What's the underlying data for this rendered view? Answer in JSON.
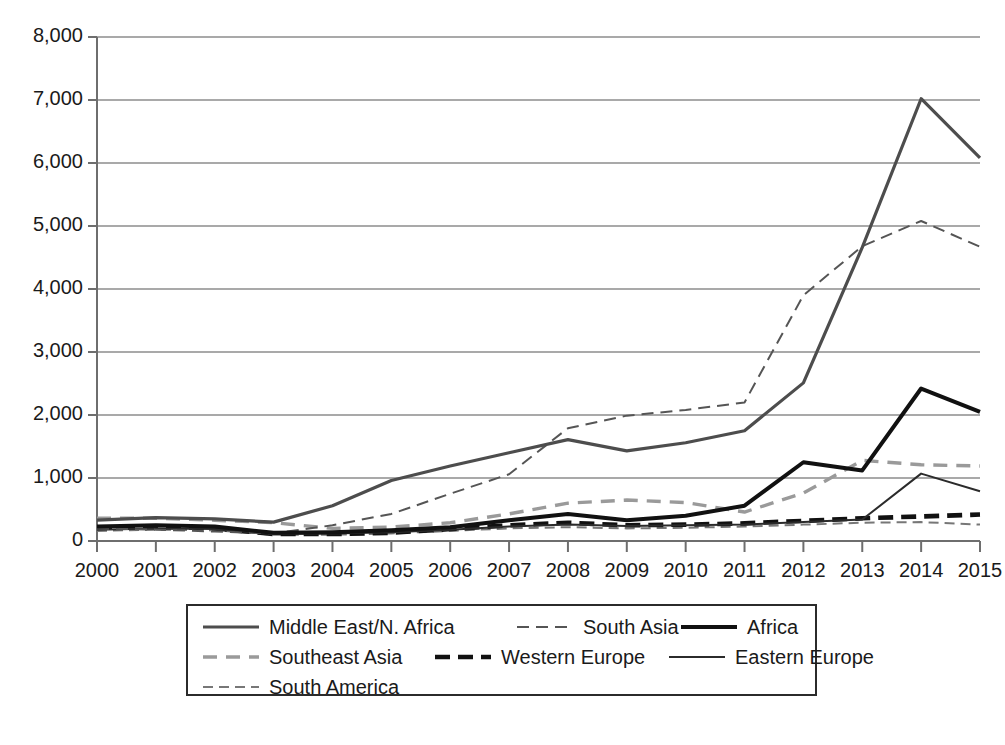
{
  "chart_data": {
    "type": "line",
    "title": "",
    "xlabel": "",
    "ylabel": "",
    "grid": true,
    "legend_position": "bottom",
    "x": [
      2000,
      2001,
      2002,
      2003,
      2004,
      2005,
      2006,
      2007,
      2008,
      2009,
      2010,
      2011,
      2012,
      2013,
      2014,
      2015
    ],
    "categories": [
      "2000",
      "2001",
      "2002",
      "2003",
      "2004",
      "2005",
      "2006",
      "2007",
      "2008",
      "2009",
      "2010",
      "2011",
      "2012",
      "2013",
      "2014",
      "2015"
    ],
    "ylim": [
      0,
      8000
    ],
    "ytick_values": [
      0,
      1000,
      2000,
      3000,
      4000,
      5000,
      6000,
      7000,
      8000
    ],
    "ytick_labels": [
      "0",
      "1,000",
      "2,000",
      "3,000",
      "4,000",
      "5,000",
      "6,000",
      "7,000",
      "8,000"
    ],
    "series": [
      {
        "name": "Middle East/N. Africa",
        "style": "solid",
        "color": "#4d4d4d",
        "width": 3.2,
        "dash": "",
        "values": [
          330,
          370,
          350,
          300,
          560,
          960,
          1190,
          1400,
          1610,
          1430,
          1560,
          1750,
          2510,
          4660,
          7020,
          6080
        ]
      },
      {
        "name": "South Asia",
        "style": "dashed",
        "color": "#555555",
        "width": 2.0,
        "dash": "12,7",
        "values": [
          200,
          180,
          150,
          120,
          250,
          430,
          750,
          1060,
          1790,
          1990,
          2080,
          2200,
          3900,
          4680,
          5080,
          4670
        ]
      },
      {
        "name": "Africa",
        "style": "solid",
        "color": "#111111",
        "width": 4.0,
        "dash": "",
        "values": [
          230,
          250,
          230,
          130,
          140,
          170,
          220,
          330,
          430,
          330,
          400,
          560,
          1250,
          1120,
          2420,
          2050
        ]
      },
      {
        "name": "Southeast Asia",
        "style": "dashed",
        "color": "#9a9a9a",
        "width": 3.4,
        "dash": "14,9",
        "values": [
          360,
          360,
          330,
          290,
          200,
          220,
          290,
          430,
          600,
          650,
          610,
          460,
          760,
          1280,
          1210,
          1190
        ]
      },
      {
        "name": "Western Europe",
        "style": "dashed",
        "color": "#111111",
        "width": 4.6,
        "dash": "15,8",
        "values": [
          210,
          230,
          200,
          110,
          110,
          130,
          190,
          250,
          290,
          250,
          260,
          280,
          320,
          360,
          390,
          420
        ]
      },
      {
        "name": "Eastern Europe",
        "style": "solid",
        "color": "#2b2b2b",
        "width": 2.0,
        "dash": "",
        "values": [
          180,
          200,
          190,
          110,
          120,
          140,
          180,
          230,
          260,
          240,
          250,
          260,
          300,
          340,
          1070,
          790
        ]
      },
      {
        "name": "South America",
        "style": "dashed",
        "color": "#777777",
        "width": 2.0,
        "dash": "10,6",
        "values": [
          160,
          180,
          170,
          100,
          100,
          120,
          160,
          200,
          220,
          200,
          210,
          230,
          260,
          290,
          300,
          260
        ]
      }
    ]
  },
  "legend": {
    "rows": [
      [
        {
          "label": "Middle East/N. Africa",
          "series": 0
        },
        {
          "label": "South Asia",
          "series": 1
        },
        {
          "label": "Africa",
          "series": 2
        }
      ],
      [
        {
          "label": "Southeast Asia",
          "series": 3
        },
        {
          "label": "Western Europe",
          "series": 4
        },
        {
          "label": "Eastern Europe",
          "series": 5
        }
      ],
      [
        {
          "label": "South America",
          "series": 6
        }
      ]
    ]
  },
  "axis": {
    "color": "#6e6e6e",
    "grid_color": "#8c8c8c"
  }
}
